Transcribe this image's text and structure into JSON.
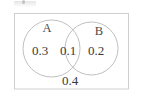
{
  "figure": {
    "type": "venn-diagram",
    "title": "",
    "universal_set": {
      "name": "universal-set-rectangle",
      "outside_value": "0.4"
    },
    "sets": [
      {
        "id": "A",
        "label": "A",
        "exclusive_value": "0.3",
        "position": "left"
      },
      {
        "id": "B",
        "label": "B",
        "exclusive_value": "0.2",
        "position": "right"
      }
    ],
    "intersection": {
      "label": "A ∩ B",
      "value": "0.1"
    },
    "colors": {
      "stroke": "#b5b5b5",
      "rect_stroke": "#cccccc",
      "text": "#3a3a3a",
      "background": "#ffffff"
    }
  }
}
